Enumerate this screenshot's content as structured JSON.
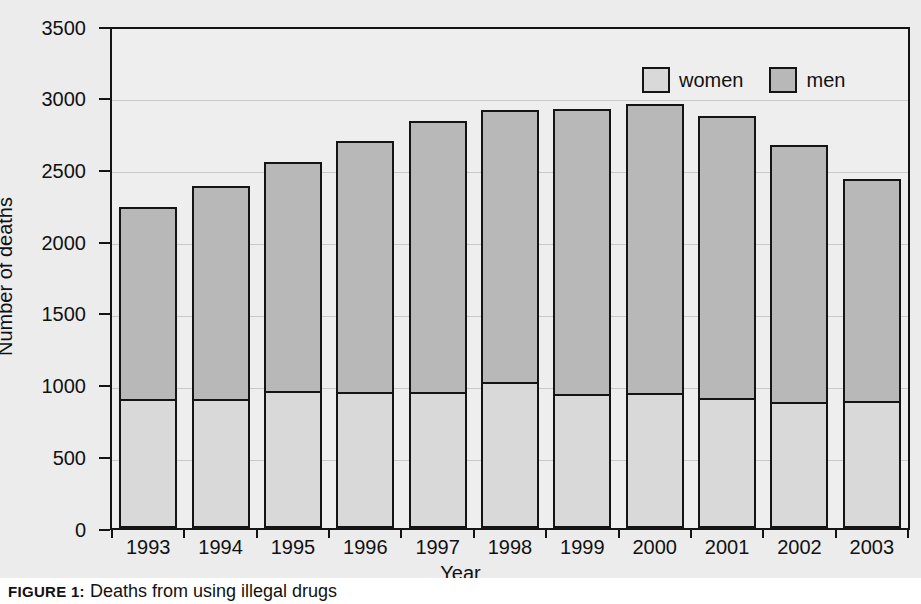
{
  "caption": {
    "prefix": "FIGURE 1:",
    "text": "Deaths from using illegal drugs"
  },
  "legend": {
    "position": "top-center-inside",
    "entries": [
      {
        "label": "women",
        "color": "#d9d9d9"
      },
      {
        "label": "men",
        "color": "#b8b8b8"
      }
    ]
  },
  "axes": {
    "y_title": "Number of deaths",
    "x_title": "Year",
    "y_ticks": [
      "0",
      "500",
      "1000",
      "1500",
      "2000",
      "2500",
      "3000",
      "3500"
    ]
  },
  "chart_data": {
    "type": "bar",
    "stacked": true,
    "title": "",
    "xlabel": "Year",
    "ylabel": "Number of deaths",
    "ylim": [
      0,
      3500
    ],
    "ytick_step": 500,
    "grid": true,
    "legend_position": "top center (inside plot)",
    "categories": [
      "1993",
      "1994",
      "1995",
      "1996",
      "1997",
      "1998",
      "1999",
      "2000",
      "2001",
      "2002",
      "2003"
    ],
    "series": [
      {
        "name": "women",
        "color": "#d9d9d9",
        "values": [
          880,
          880,
          935,
          925,
          925,
          995,
          915,
          920,
          885,
          855,
          865
        ]
      },
      {
        "name": "men",
        "color": "#b8b8b8",
        "values": [
          1370,
          1520,
          1635,
          1790,
          1930,
          1940,
          2025,
          2055,
          2005,
          1830,
          1580
        ]
      }
    ],
    "totals": [
      2250,
      2400,
      2570,
      2715,
      2855,
      2935,
      2940,
      2975,
      2890,
      2685,
      2445
    ]
  }
}
